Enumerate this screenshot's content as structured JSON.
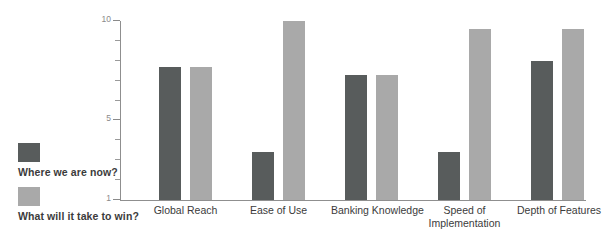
{
  "chart_data": {
    "type": "bar",
    "title": "",
    "subtitle": "",
    "xlabel": "",
    "ylabel": "",
    "ylim": [
      1,
      10
    ],
    "yticks": [
      1,
      5,
      10
    ],
    "ytick_labels": [
      "1",
      "5",
      "10"
    ],
    "minor_ticks": [
      2,
      3,
      4,
      6,
      7,
      8,
      9
    ],
    "grid": false,
    "legend_position": "left",
    "categories": [
      "Global Reach",
      "Ease of Use",
      "Banking Knowledge",
      "Speed of Implementation",
      "Depth of Features"
    ],
    "category_label_lines": [
      [
        "Global Reach"
      ],
      [
        "Ease of Use"
      ],
      [
        "Banking Knowledge"
      ],
      [
        "Speed of",
        "Implementation"
      ],
      [
        "Depth of Features"
      ]
    ],
    "series": [
      {
        "name": "Where we are now?",
        "color": "#585c5c",
        "values": [
          7.7,
          3.4,
          7.3,
          3.4,
          8.0
        ]
      },
      {
        "name": "What will it take to win?",
        "color": "#a9a9a9",
        "values": [
          7.7,
          10.0,
          7.3,
          9.6,
          9.6
        ]
      }
    ]
  },
  "legend": {
    "entries": [
      {
        "label": "Where we are now?",
        "color": "#585c5c"
      },
      {
        "label": "What will it take to win?",
        "color": "#a9a9a9"
      }
    ]
  },
  "axis": {
    "line_color": "#8f8f8f",
    "tick_color": "#8a8a8a"
  }
}
